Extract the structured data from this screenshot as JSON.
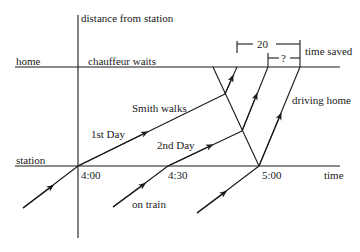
{
  "diagram": {
    "axes": {
      "y_label": "distance from station",
      "x_label": "time",
      "home_label": "home",
      "station_label": "station"
    },
    "ticks": {
      "t400": "4:00",
      "t430": "4:30",
      "t500": "5:00"
    },
    "annotations": {
      "chauffeur_waits": "chauffeur waits",
      "smith_walks": "Smith walks",
      "first_day": "1st Day",
      "second_day": "2nd Day",
      "on_train": "on train",
      "driving_home": "driving home",
      "time_saved": "time saved",
      "bracket_20": "20",
      "bracket_unknown": "?"
    },
    "colors": {
      "ink": "#1a1a1a",
      "background": "#ffffff"
    }
  }
}
